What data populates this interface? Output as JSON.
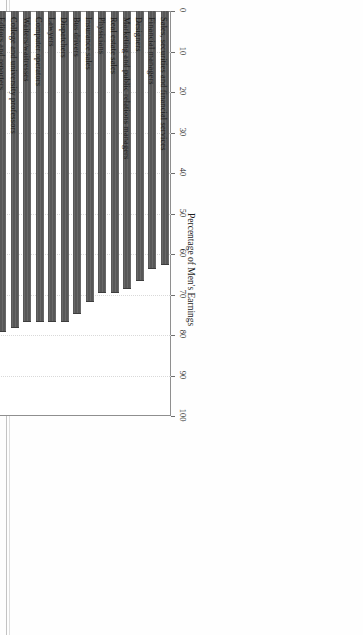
{
  "figure": {
    "orientation": "rotated-90-on-page",
    "value_axis_title": "Percentage of Men's Earnings",
    "value_tick_labels": [
      "0",
      "10",
      "20",
      "30",
      "40",
      "50",
      "60",
      "70",
      "80",
      "90",
      "100"
    ],
    "bar_color": "#575757",
    "frame_color": "#8f8f8f",
    "grid_color": "#d9d9d9"
  },
  "scan_artifacts": {
    "left_mark_top": "+",
    "left_mark_mid": "0",
    "left_mark_low": "0"
  },
  "chart_data": {
    "type": "bar",
    "title": "",
    "xlabel": "",
    "ylabel": "Percentage of Men's Earnings",
    "ylim": [
      0,
      100
    ],
    "yticks": [
      0,
      10,
      20,
      30,
      40,
      50,
      60,
      70,
      80,
      90,
      100
    ],
    "grid": true,
    "orientation": "vertical",
    "legend": false,
    "categories": [
      "Sales, securities and financial services",
      "Financial managers",
      "Designers",
      "Marketing and public relations managers",
      "Real estate sales",
      "Physicians",
      "Insurance sales",
      "Bus drivers",
      "Dispatchers",
      "Lawyers",
      "Computer operators",
      "Waiters/waitresses",
      "College and university professors",
      "Editors and reporters",
      "Assemblers",
      "Bartenders",
      "Cooks (except short order)",
      "Janitors/cleaners",
      "Textile sewing-machine operators",
      "Computer programmers",
      "Engineers",
      "Social workers",
      "Cashiers",
      "Registered nurses"
    ],
    "values": [
      62.5,
      63.5,
      66.5,
      68.5,
      69.5,
      69.5,
      71.5,
      74.5,
      76.5,
      76.5,
      76.5,
      76.5,
      78.0,
      79.0,
      79.5,
      82.5,
      84.5,
      84.5,
      84.5,
      85.0,
      87.0,
      88.5,
      89.5,
      97.5
    ]
  }
}
